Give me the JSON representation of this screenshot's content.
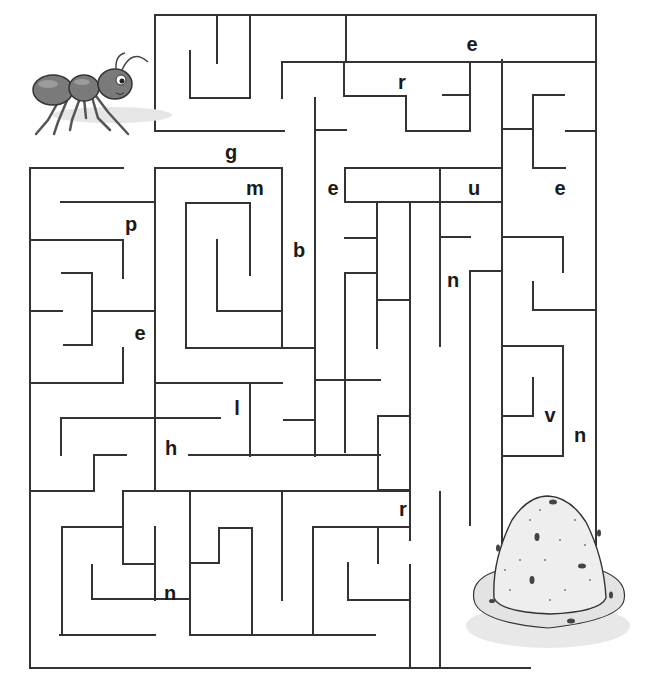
{
  "puzzle": {
    "type": "maze",
    "start_label": "ant",
    "end_label": "anthill",
    "letters": [
      {
        "char": "e",
        "x": 472,
        "y": 44
      },
      {
        "char": "r",
        "x": 402,
        "y": 82
      },
      {
        "char": "g",
        "x": 231,
        "y": 152
      },
      {
        "char": "m",
        "x": 255,
        "y": 188
      },
      {
        "char": "e",
        "x": 333,
        "y": 188
      },
      {
        "char": "u",
        "x": 474,
        "y": 188
      },
      {
        "char": "e",
        "x": 560,
        "y": 188
      },
      {
        "char": "p",
        "x": 131,
        "y": 224
      },
      {
        "char": "b",
        "x": 299,
        "y": 250
      },
      {
        "char": "n",
        "x": 453,
        "y": 280
      },
      {
        "char": "e",
        "x": 140,
        "y": 333
      },
      {
        "char": "l",
        "x": 237,
        "y": 408
      },
      {
        "char": "v",
        "x": 550,
        "y": 415
      },
      {
        "char": "n",
        "x": 580,
        "y": 435
      },
      {
        "char": "h",
        "x": 171,
        "y": 448
      },
      {
        "char": "r",
        "x": 403,
        "y": 509
      },
      {
        "char": "n",
        "x": 170,
        "y": 593
      }
    ],
    "colors": {
      "wall": "#333333",
      "background": "#ffffff",
      "letter": "#1a1a1a"
    }
  },
  "walls": [
    [
      155,
      15,
      596,
      15
    ],
    [
      155,
      15,
      155,
      131
    ],
    [
      155,
      131,
      284,
      131
    ],
    [
      217,
      15,
      217,
      63
    ],
    [
      190,
      51,
      190,
      98
    ],
    [
      190,
      98,
      250,
      98
    ],
    [
      250,
      15,
      250,
      98
    ],
    [
      282,
      62,
      282,
      98
    ],
    [
      282,
      62,
      596,
      62
    ],
    [
      346,
      15,
      346,
      62
    ],
    [
      346,
      62,
      440,
      62
    ],
    [
      344,
      62,
      344,
      96
    ],
    [
      344,
      96,
      406,
      96
    ],
    [
      406,
      96,
      406,
      131
    ],
    [
      406,
      131,
      470,
      131
    ],
    [
      470,
      62,
      470,
      131
    ],
    [
      443,
      95,
      470,
      95
    ],
    [
      315,
      98,
      315,
      420
    ],
    [
      315,
      130,
      346,
      130
    ],
    [
      502,
      60,
      502,
      555
    ],
    [
      535,
      62,
      596,
      62
    ],
    [
      596,
      15,
      596,
      640
    ],
    [
      533,
      95,
      564,
      95
    ],
    [
      533,
      95,
      533,
      168
    ],
    [
      502,
      129,
      533,
      129
    ],
    [
      566,
      131,
      596,
      131
    ],
    [
      533,
      168,
      565,
      168
    ],
    [
      30,
      168,
      123,
      168
    ],
    [
      30,
      168,
      30,
      668
    ],
    [
      61,
      202,
      155,
      202
    ],
    [
      155,
      168,
      155,
      420
    ],
    [
      155,
      168,
      282,
      168
    ],
    [
      282,
      168,
      282,
      348
    ],
    [
      186,
      203,
      250,
      203
    ],
    [
      186,
      203,
      250,
      203
    ],
    [
      250,
      203,
      250,
      275
    ],
    [
      186,
      203,
      186,
      348
    ],
    [
      217,
      240,
      217,
      311
    ],
    [
      217,
      311,
      282,
      311
    ],
    [
      186,
      348,
      315,
      348
    ],
    [
      315,
      168,
      315,
      203
    ],
    [
      345,
      168,
      500,
      168
    ],
    [
      345,
      168,
      345,
      202
    ],
    [
      345,
      202,
      500,
      202
    ],
    [
      440,
      168,
      440,
      346
    ],
    [
      440,
      237,
      470,
      237
    ],
    [
      470,
      202,
      500,
      202
    ],
    [
      410,
      202,
      410,
      540
    ],
    [
      377,
      202,
      377,
      348
    ],
    [
      345,
      238,
      377,
      238
    ],
    [
      345,
      273,
      377,
      273
    ],
    [
      345,
      273,
      345,
      380
    ],
    [
      345,
      380,
      380,
      380
    ],
    [
      377,
      300,
      410,
      300
    ],
    [
      472,
      271,
      502,
      271
    ],
    [
      472,
      271,
      502,
      271
    ],
    [
      470,
      271,
      470,
      525
    ],
    [
      502,
      237,
      563,
      237
    ],
    [
      563,
      237,
      563,
      272
    ],
    [
      533,
      282,
      533,
      310
    ],
    [
      533,
      310,
      596,
      310
    ],
    [
      502,
      346,
      563,
      346
    ],
    [
      563,
      346,
      563,
      456
    ],
    [
      502,
      456,
      563,
      456
    ],
    [
      533,
      378,
      533,
      416
    ],
    [
      502,
      416,
      533,
      416
    ],
    [
      30,
      240,
      123,
      240
    ],
    [
      123,
      240,
      123,
      278
    ],
    [
      62,
      273,
      92,
      273
    ],
    [
      92,
      273,
      92,
      345
    ],
    [
      64,
      345,
      92,
      345
    ],
    [
      30,
      311,
      62,
      311
    ],
    [
      92,
      311,
      155,
      311
    ],
    [
      123,
      348,
      123,
      383
    ],
    [
      30,
      383,
      123,
      383
    ],
    [
      155,
      383,
      282,
      383
    ],
    [
      250,
      383,
      250,
      456
    ],
    [
      284,
      420,
      315,
      420
    ],
    [
      315,
      420,
      315,
      456
    ],
    [
      315,
      380,
      345,
      380
    ],
    [
      345,
      380,
      345,
      452
    ],
    [
      378,
      416,
      410,
      416
    ],
    [
      378,
      416,
      378,
      490
    ],
    [
      378,
      490,
      410,
      490
    ],
    [
      410,
      456,
      410,
      490
    ],
    [
      61,
      418,
      220,
      418
    ],
    [
      61,
      418,
      61,
      455
    ],
    [
      94,
      455,
      126,
      455
    ],
    [
      94,
      455,
      94,
      491
    ],
    [
      30,
      491,
      94,
      491
    ],
    [
      155,
      418,
      155,
      491
    ],
    [
      189,
      455,
      380,
      455
    ],
    [
      123,
      491,
      408,
      491
    ],
    [
      123,
      491,
      123,
      564
    ],
    [
      62,
      527,
      123,
      527
    ],
    [
      62,
      527,
      62,
      635
    ],
    [
      92,
      565,
      92,
      599
    ],
    [
      92,
      599,
      190,
      599
    ],
    [
      155,
      527,
      155,
      600
    ],
    [
      123,
      564,
      155,
      564
    ],
    [
      190,
      491,
      190,
      600
    ],
    [
      190,
      600,
      190,
      635
    ],
    [
      190,
      635,
      375,
      635
    ],
    [
      219,
      528,
      252,
      528
    ],
    [
      219,
      528,
      219,
      563
    ],
    [
      190,
      563,
      219,
      563
    ],
    [
      252,
      528,
      252,
      635
    ],
    [
      282,
      491,
      282,
      600
    ],
    [
      313,
      527,
      408,
      527
    ],
    [
      313,
      527,
      313,
      635
    ],
    [
      378,
      527,
      378,
      563
    ],
    [
      348,
      563,
      348,
      600
    ],
    [
      348,
      600,
      410,
      600
    ],
    [
      410,
      565,
      410,
      668
    ],
    [
      440,
      492,
      440,
      668
    ],
    [
      30,
      668,
      530,
      668
    ],
    [
      60,
      635,
      155,
      635
    ]
  ]
}
